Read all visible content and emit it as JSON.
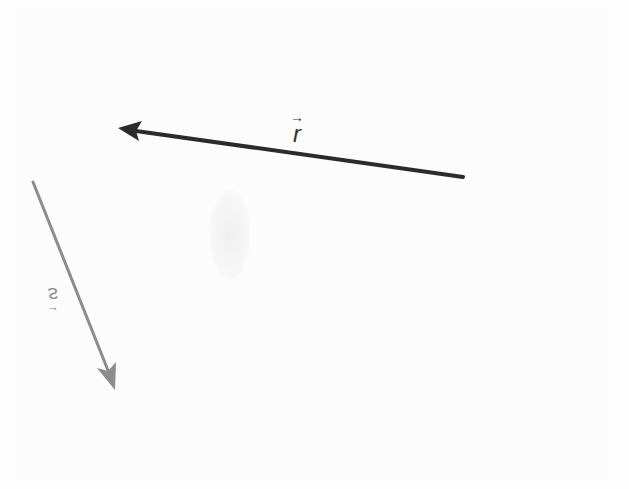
{
  "diagram": {
    "background_color": "#fdfdfd",
    "vectors": [
      {
        "name": "r",
        "label": "r",
        "arrow_mark": "→",
        "color": "#2b2b2b",
        "stroke_width": 4,
        "tail": [
          463,
          177
        ],
        "tip": [
          118,
          128
        ]
      },
      {
        "name": "s",
        "label": "s",
        "arrow_mark": "→",
        "color": "#8c8c8c",
        "stroke_width": 3,
        "tail": [
          33,
          182
        ],
        "tip": [
          115,
          390
        ]
      }
    ]
  }
}
